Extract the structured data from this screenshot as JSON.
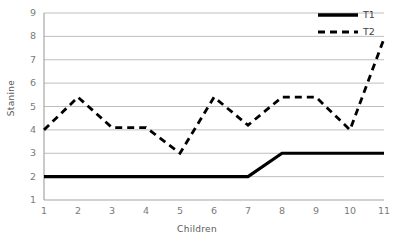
{
  "chart_data": {
    "type": "line",
    "title": "",
    "xlabel": "Children",
    "ylabel": "Stanine",
    "x": [
      1,
      2,
      3,
      4,
      5,
      6,
      7,
      8,
      9,
      10,
      11
    ],
    "categories": [
      "1",
      "2",
      "3",
      "4",
      "5",
      "6",
      "7",
      "8",
      "9",
      "10",
      "11"
    ],
    "xlim": [
      1,
      11
    ],
    "ylim": [
      1,
      9
    ],
    "y_ticks": [
      "1",
      "2",
      "3",
      "4",
      "5",
      "6",
      "7",
      "8",
      "9"
    ],
    "x_ticks": [
      "1",
      "2",
      "3",
      "4",
      "5",
      "6",
      "7",
      "8",
      "9",
      "10",
      "11"
    ],
    "grid": "horizontal",
    "legend_position": "top-right",
    "series": [
      {
        "name": "T1",
        "style": "solid",
        "color": "#000000",
        "values": [
          2,
          2,
          2,
          2,
          2,
          2,
          2,
          3,
          3,
          3,
          3
        ]
      },
      {
        "name": "T2",
        "style": "dashed",
        "color": "#000000",
        "values": [
          4,
          5.4,
          4.1,
          4.1,
          3,
          5.4,
          4.2,
          5.4,
          5.4,
          4,
          7.9
        ]
      }
    ]
  },
  "legend": {
    "items": [
      {
        "label": "T1",
        "style": "solid"
      },
      {
        "label": "T2",
        "style": "dashed"
      }
    ]
  },
  "colors": {
    "series": "#000000",
    "grid": "#bfbfbf",
    "axis": "#a6a6a6",
    "tick_text": "#7a7a7a",
    "title_text": "#595959",
    "background": "#ffffff"
  }
}
